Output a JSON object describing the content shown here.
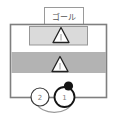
{
  "diagram": {
    "goal_label": "ゴール",
    "lanes": [
      {
        "name": "upper-lane",
        "fill": "#dadada"
      },
      {
        "name": "lower-lane",
        "fill": "#b3b3b3"
      }
    ],
    "pawns": [
      {
        "name": "upper-pawn",
        "shape": "triangle-outline"
      },
      {
        "name": "lower-pawn",
        "shape": "triangle-outline"
      }
    ],
    "players": [
      {
        "label": "2"
      },
      {
        "label": "1"
      }
    ],
    "colors": {
      "board_border": "#7f7f7f",
      "goal_box_border": "#9a9a9a",
      "pawn_outline": "#222222",
      "marker_dot": "#141414",
      "move_arc": "#9b9b9b"
    }
  }
}
